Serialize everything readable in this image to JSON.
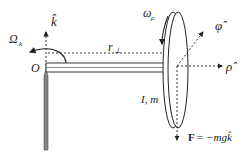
{
  "diagram": {
    "type": "physics-gyroscope",
    "labels": {
      "k_hat": "k̂",
      "Omega_k": "Ω",
      "Omega_sub": "k",
      "origin": "O",
      "r_perp": "r",
      "r_perp_sub": "⊥",
      "omega_rho": "ω",
      "omega_rho_sub": "ρ",
      "phi_hat": "φ̂",
      "rho_hat": "ρ̂",
      "inertia_mass": "I, m",
      "force_F": "F",
      "force_eq": " = −mgk̂"
    },
    "colors": {
      "line": "#222222",
      "rod_fill": "#ffffff",
      "pivot_fill": "#888888"
    }
  }
}
